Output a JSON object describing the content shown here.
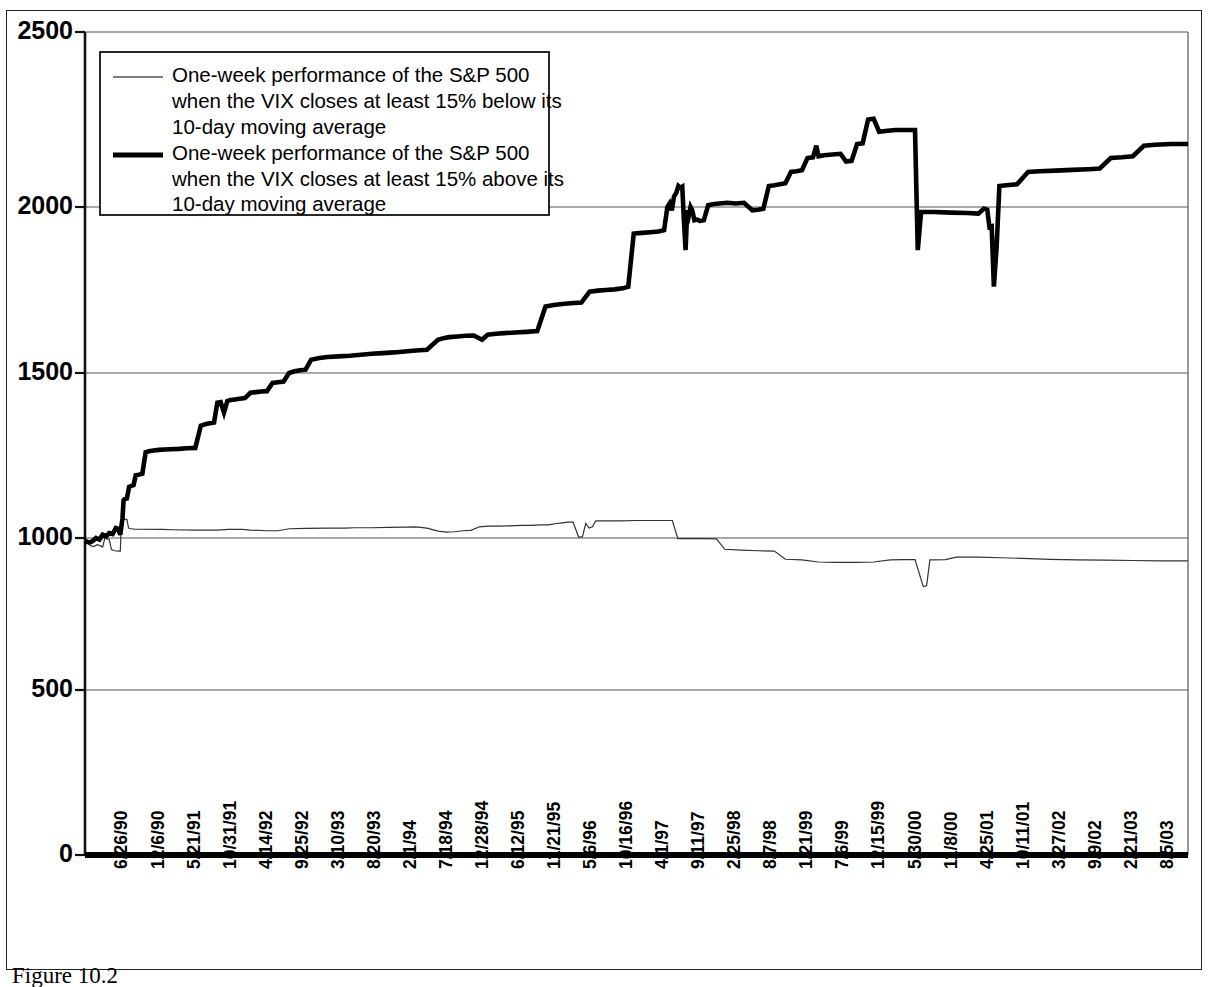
{
  "figure": {
    "caption": "Figure 10.2",
    "frame_color": "#222222"
  },
  "chart_data": {
    "type": "line",
    "title": "",
    "subtitle": "",
    "xlabel": "",
    "ylabel": "",
    "ylim": [
      0,
      2500
    ],
    "yticks": [
      0,
      500,
      1000,
      1500,
      2000,
      2500
    ],
    "ytick_labels": [
      "0",
      "500",
      "1000",
      "1500",
      "2000",
      "2500"
    ],
    "grid": true,
    "grid_axis": "y",
    "legend_position": "top-left-inside",
    "x_tick_rotation": -90,
    "x_tick_labels": [
      "6/26/90",
      "12/6/90",
      "5/21/91",
      "10/31/91",
      "4/14/92",
      "9/25/92",
      "3/10/93",
      "8/20/93",
      "2/1/94",
      "7/18/94",
      "12/28/94",
      "6/12/95",
      "11/21/95",
      "5/6/96",
      "10/16/96",
      "4/1/97",
      "9/11/97",
      "2/25/98",
      "8/7/98",
      "1/21/99",
      "7/6/99",
      "12/15/99",
      "5/30/00",
      "11/8/00",
      "4/25/01",
      "10/11/01",
      "3/27/02",
      "9/9/02",
      "2/21/03",
      "8/5/03"
    ],
    "series": [
      {
        "name": "One-week performance of the S&P 500 when the VIX closes at least 15% below its 10-day moving average",
        "style": "thin",
        "color": "#333333",
        "line_width": 1.2,
        "start_value": 985,
        "end_value": 925,
        "min_value": 840,
        "max_value": 1057,
        "points": [
          [
            0.0,
            985
          ],
          [
            0.6,
            982
          ],
          [
            1.0,
            975
          ],
          [
            1.6,
            972
          ],
          [
            2.2,
            978
          ],
          [
            2.8,
            974
          ],
          [
            3.2,
            970
          ],
          [
            3.6,
            1000
          ],
          [
            4.0,
            997
          ],
          [
            4.4,
            995
          ],
          [
            4.8,
            962
          ],
          [
            5.4,
            958
          ],
          [
            6.0,
            957
          ],
          [
            6.4,
            957
          ],
          [
            6.6,
            1055
          ],
          [
            7.2,
            1057
          ],
          [
            7.6,
            1056
          ],
          [
            7.9,
            1030
          ],
          [
            8.4,
            1028
          ],
          [
            9.0,
            1027
          ],
          [
            14.0,
            1026
          ],
          [
            16.0,
            1025
          ],
          [
            20.0,
            1024
          ],
          [
            24.0,
            1024
          ],
          [
            26.0,
            1026
          ],
          [
            28.5,
            1026
          ],
          [
            30.0,
            1024
          ],
          [
            33.0,
            1022
          ],
          [
            35.0,
            1022
          ],
          [
            37.0,
            1028
          ],
          [
            40.0,
            1029
          ],
          [
            44.0,
            1030
          ],
          [
            47.0,
            1030
          ],
          [
            49.0,
            1031
          ],
          [
            52.0,
            1031
          ],
          [
            55.0,
            1032
          ],
          [
            58.0,
            1033
          ],
          [
            60.0,
            1034
          ],
          [
            62.0,
            1030
          ],
          [
            64.0,
            1021
          ],
          [
            65.5,
            1018
          ],
          [
            67.0,
            1019
          ],
          [
            68.5,
            1022
          ],
          [
            70.0,
            1023
          ],
          [
            71.5,
            1034
          ],
          [
            73.0,
            1036
          ],
          [
            75.0,
            1036
          ],
          [
            77.0,
            1037
          ],
          [
            79.0,
            1038
          ],
          [
            81.0,
            1038
          ],
          [
            82.5,
            1040
          ],
          [
            84.0,
            1040
          ],
          [
            85.5,
            1044
          ],
          [
            86.5,
            1046
          ],
          [
            87.5,
            1048
          ],
          [
            88.5,
            1048
          ],
          [
            89.5,
            1003
          ],
          [
            90.2,
            1004
          ],
          [
            90.8,
            1044
          ],
          [
            91.4,
            1030
          ],
          [
            92.0,
            1034
          ],
          [
            92.6,
            1052
          ],
          [
            94.0,
            1052
          ],
          [
            97.0,
            1052
          ],
          [
            100.0,
            1053
          ],
          [
            103.0,
            1053
          ],
          [
            105.0,
            1053
          ],
          [
            106.5,
            1053
          ],
          [
            107.5,
            998
          ],
          [
            112.0,
            998
          ],
          [
            114.5,
            997
          ],
          [
            116.0,
            963
          ],
          [
            119.0,
            960
          ],
          [
            122.0,
            958
          ],
          [
            125.0,
            957
          ],
          [
            127.0,
            930
          ],
          [
            130.0,
            928
          ],
          [
            133.0,
            921
          ],
          [
            136.0,
            920
          ],
          [
            140.0,
            920
          ],
          [
            143.0,
            921
          ],
          [
            146.0,
            928
          ],
          [
            148.5,
            929
          ],
          [
            150.5,
            929
          ],
          [
            152.0,
            840
          ],
          [
            152.6,
            843
          ],
          [
            153.2,
            928
          ],
          [
            156.0,
            929
          ],
          [
            158.0,
            937
          ],
          [
            162.0,
            937
          ],
          [
            166.0,
            935
          ],
          [
            170.0,
            933
          ],
          [
            175.0,
            930
          ],
          [
            180.0,
            928
          ],
          [
            185.0,
            927
          ],
          [
            190.0,
            926
          ],
          [
            195.0,
            925
          ],
          [
            200.0,
            925
          ]
        ]
      },
      {
        "name": "One-week performance of the S&P 500 when the VIX closes at least 15% above its 10-day moving average",
        "style": "thick",
        "color": "#000000",
        "line_width": 4.6,
        "start_value": 990,
        "end_value": 2180,
        "min_value": 975,
        "max_value": 2250,
        "points": [
          [
            0.0,
            990
          ],
          [
            0.8,
            985
          ],
          [
            1.4,
            990
          ],
          [
            2.0,
            1000
          ],
          [
            2.6,
            995
          ],
          [
            3.2,
            1010
          ],
          [
            3.8,
            1005
          ],
          [
            4.4,
            1015
          ],
          [
            5.0,
            1012
          ],
          [
            5.6,
            1030
          ],
          [
            6.0,
            1028
          ],
          [
            6.4,
            1010
          ],
          [
            6.8,
            1060
          ],
          [
            7.0,
            1115
          ],
          [
            7.2,
            1118
          ],
          [
            7.6,
            1120
          ],
          [
            8.0,
            1155
          ],
          [
            8.4,
            1158
          ],
          [
            8.8,
            1160
          ],
          [
            9.2,
            1190
          ],
          [
            9.8,
            1192
          ],
          [
            10.4,
            1195
          ],
          [
            11.0,
            1260
          ],
          [
            11.6,
            1263
          ],
          [
            12.4,
            1265
          ],
          [
            13.4,
            1267
          ],
          [
            14.4,
            1268
          ],
          [
            15.4,
            1269
          ],
          [
            17.0,
            1270
          ],
          [
            18.5,
            1272
          ],
          [
            20.0,
            1273
          ],
          [
            21.0,
            1340
          ],
          [
            21.8,
            1345
          ],
          [
            22.6,
            1348
          ],
          [
            23.4,
            1350
          ],
          [
            24.0,
            1410
          ],
          [
            24.6,
            1412
          ],
          [
            25.2,
            1380
          ],
          [
            25.8,
            1415
          ],
          [
            26.4,
            1418
          ],
          [
            27.2,
            1420
          ],
          [
            28.0,
            1422
          ],
          [
            29.0,
            1424
          ],
          [
            30.0,
            1440
          ],
          [
            31.0,
            1442
          ],
          [
            32.0,
            1444
          ],
          [
            33.0,
            1445
          ],
          [
            34.0,
            1470
          ],
          [
            35.0,
            1472
          ],
          [
            36.0,
            1474
          ],
          [
            37.0,
            1500
          ],
          [
            38.0,
            1505
          ],
          [
            39.0,
            1508
          ],
          [
            40.0,
            1510
          ],
          [
            41.0,
            1540
          ],
          [
            42.5,
            1545
          ],
          [
            44.0,
            1548
          ],
          [
            46.0,
            1550
          ],
          [
            48.0,
            1552
          ],
          [
            50.0,
            1555
          ],
          [
            52.0,
            1558
          ],
          [
            54.0,
            1560
          ],
          [
            56.0,
            1562
          ],
          [
            58.0,
            1565
          ],
          [
            60.0,
            1568
          ],
          [
            62.0,
            1570
          ],
          [
            64.0,
            1600
          ],
          [
            65.0,
            1605
          ],
          [
            66.0,
            1608
          ],
          [
            67.5,
            1610
          ],
          [
            69.0,
            1612
          ],
          [
            70.5,
            1613
          ],
          [
            72.0,
            1600
          ],
          [
            73.0,
            1615
          ],
          [
            74.5,
            1618
          ],
          [
            76.0,
            1620
          ],
          [
            78.0,
            1622
          ],
          [
            80.0,
            1624
          ],
          [
            82.0,
            1626
          ],
          [
            83.5,
            1700
          ],
          [
            85.0,
            1705
          ],
          [
            86.5,
            1708
          ],
          [
            88.0,
            1710
          ],
          [
            90.0,
            1712
          ],
          [
            91.5,
            1745
          ],
          [
            93.0,
            1748
          ],
          [
            94.5,
            1750
          ],
          [
            96.0,
            1752
          ],
          [
            97.5,
            1755
          ],
          [
            98.5,
            1760
          ],
          [
            99.5,
            1920
          ],
          [
            101.0,
            1922
          ],
          [
            102.5,
            1924
          ],
          [
            104.0,
            1926
          ],
          [
            105.0,
            1930
          ],
          [
            105.6,
            2000
          ],
          [
            106.0,
            2010
          ],
          [
            106.4,
            1990
          ],
          [
            106.8,
            2030
          ],
          [
            107.2,
            2040
          ],
          [
            107.6,
            2060
          ],
          [
            108.0,
            2055
          ],
          [
            108.3,
            2058
          ],
          [
            108.6,
            1960
          ],
          [
            108.9,
            1870
          ],
          [
            109.2,
            1990
          ],
          [
            109.5,
            1975
          ],
          [
            109.8,
            2000
          ],
          [
            110.1,
            1990
          ],
          [
            110.5,
            1960
          ],
          [
            111.0,
            1962
          ],
          [
            111.5,
            1958
          ],
          [
            112.2,
            1960
          ],
          [
            113.0,
            2005
          ],
          [
            113.8,
            2008
          ],
          [
            115.0,
            2010
          ],
          [
            116.5,
            2012
          ],
          [
            118.0,
            2010
          ],
          [
            119.5,
            2012
          ],
          [
            121.0,
            1990
          ],
          [
            122.0,
            1992
          ],
          [
            123.0,
            1995
          ],
          [
            124.0,
            2060
          ],
          [
            125.0,
            2062
          ],
          [
            126.0,
            2065
          ],
          [
            127.0,
            2068
          ],
          [
            128.0,
            2100
          ],
          [
            129.0,
            2102
          ],
          [
            130.0,
            2105
          ],
          [
            131.0,
            2140
          ],
          [
            132.0,
            2142
          ],
          [
            132.6,
            2175
          ],
          [
            133.0,
            2145
          ],
          [
            134.0,
            2148
          ],
          [
            135.5,
            2150
          ],
          [
            137.0,
            2152
          ],
          [
            138.0,
            2130
          ],
          [
            139.0,
            2132
          ],
          [
            140.0,
            2180
          ],
          [
            141.0,
            2182
          ],
          [
            142.0,
            2250
          ],
          [
            143.0,
            2252
          ],
          [
            144.0,
            2215
          ],
          [
            145.5,
            2218
          ],
          [
            147.0,
            2220
          ],
          [
            149.0,
            2220
          ],
          [
            150.5,
            2220
          ],
          [
            151.0,
            1870
          ],
          [
            151.6,
            1985
          ],
          [
            154.0,
            1985
          ],
          [
            157.0,
            1983
          ],
          [
            160.0,
            1982
          ],
          [
            162.0,
            1980
          ],
          [
            163.0,
            1995
          ],
          [
            163.6,
            1992
          ],
          [
            164.0,
            1940
          ],
          [
            164.4,
            1942
          ],
          [
            164.8,
            1760
          ],
          [
            165.3,
            1880
          ],
          [
            165.8,
            2060
          ],
          [
            167.0,
            2062
          ],
          [
            169.0,
            2065
          ],
          [
            171.0,
            2100
          ],
          [
            173.0,
            2102
          ],
          [
            176.0,
            2104
          ],
          [
            179.0,
            2106
          ],
          [
            182.0,
            2108
          ],
          [
            184.0,
            2110
          ],
          [
            186.0,
            2140
          ],
          [
            188.0,
            2142
          ],
          [
            190.0,
            2145
          ],
          [
            192.0,
            2175
          ],
          [
            194.0,
            2178
          ],
          [
            197.0,
            2180
          ],
          [
            200.0,
            2180
          ]
        ]
      }
    ]
  },
  "legend": {
    "entries": [
      {
        "swatch": "thin-line-swatch",
        "lines": [
          "One-week performance of the S&P 500",
          "when the VIX closes at least 15% below its",
          "10-day moving average"
        ]
      },
      {
        "swatch": "thick-line-swatch",
        "lines": [
          "One-week performance of the S&P 500",
          "when the VIX closes at least 15% above its",
          "10-day moving average"
        ]
      }
    ]
  }
}
